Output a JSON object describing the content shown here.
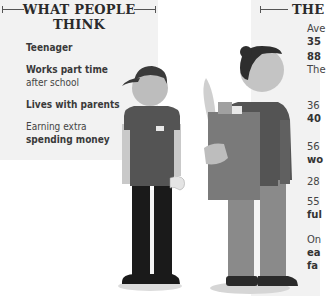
{
  "left": {
    "heading_line1": "WHAT PEOPLE",
    "heading_line2": "THINK",
    "items": [
      {
        "bold": "Teenager",
        "normal": ""
      },
      {
        "bold": "Works part time",
        "normal": "after school"
      },
      {
        "bold": "Lives with parents",
        "normal": ""
      },
      {
        "normal": "Earning extra",
        "bold": "spending money"
      }
    ]
  },
  "right": {
    "heading": "THE",
    "items": [
      {
        "line1": "Ave",
        "line2": "35"
      },
      {
        "line1": "88",
        "line2": "The"
      },
      {
        "line1": "36",
        "line2": "40"
      },
      {
        "line1": "56",
        "line2": "wo"
      },
      {
        "line1": "28",
        "line2": ""
      },
      {
        "line1": "55",
        "line2": "ful"
      },
      {
        "line1": "On",
        "line2": "ea",
        "line3": "fa"
      }
    ]
  },
  "figures": {
    "teen": "teenager-figure",
    "adult": "adult-woman-figure"
  }
}
